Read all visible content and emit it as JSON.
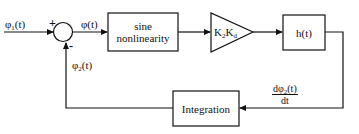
{
  "diagram": {
    "type": "block-diagram",
    "title": "",
    "signals": {
      "input": {
        "base": "φ",
        "sub": "1",
        "suffix": "(t)"
      },
      "error": {
        "text": "φ(t)"
      },
      "feedback": {
        "base": "φ",
        "sub": "2",
        "suffix": "(t)"
      },
      "derivative": {
        "num_base": "dφ",
        "num_sub": "2",
        "num_suffix": "(t)",
        "den": "dt"
      }
    },
    "summing_junction": {
      "plus_sign": "+",
      "minus_sign": "-"
    },
    "blocks": {
      "sine": {
        "line1": "sine",
        "line2": "nonlinearity"
      },
      "gain": {
        "k1": "K",
        "k1_sub": "2",
        "k2": "K",
        "k2_sub": "d"
      },
      "filter": {
        "label": "h(t)"
      },
      "integration": {
        "label": "Integration"
      }
    },
    "colors": {
      "stroke": "#111111",
      "background": "#ffffff"
    }
  }
}
